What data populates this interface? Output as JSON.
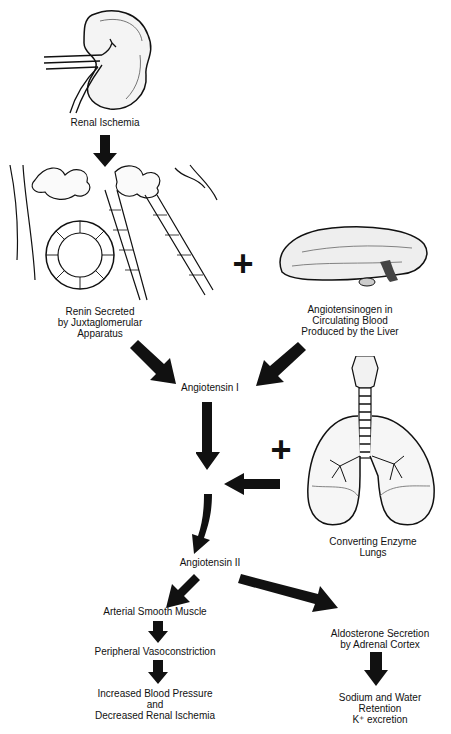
{
  "diagram": {
    "nodes": {
      "renal_ischemia": "Renal Ischemia",
      "renin_1": "Renin Secreted",
      "renin_2": "by Juxtaglomerular",
      "renin_3": "Apparatus",
      "angiotensinogen_1": "Angiotensinogen in",
      "angiotensinogen_2": "Circulating Blood",
      "angiotensinogen_3": "Produced by the Liver",
      "angiotensin_1": "Angiotensin I",
      "enzyme_1": "Converting Enzyme",
      "enzyme_2": "Lungs",
      "angiotensin_2": "Angiotensin II",
      "arterial": "Arterial Smooth Muscle",
      "peripheral": "Peripheral Vasoconstriction",
      "bp_1": "Increased Blood Pressure",
      "bp_2": "and",
      "bp_3": "Decreased Renal Ischemia",
      "aldo_1": "Aldosterone Secretion",
      "aldo_2": "by Adrenal Cortex",
      "sodium_1": "Sodium and Water",
      "sodium_2": "Retention",
      "sodium_3": "K⁺ excretion"
    },
    "operators": {
      "plus_liver": "+",
      "plus_lungs": "+"
    },
    "illustrations": [
      "kidney-icon",
      "juxtaglomerular-apparatus-icon",
      "liver-icon",
      "lungs-icon"
    ],
    "colors": {
      "ink": "#111111",
      "background": "#ffffff"
    }
  }
}
